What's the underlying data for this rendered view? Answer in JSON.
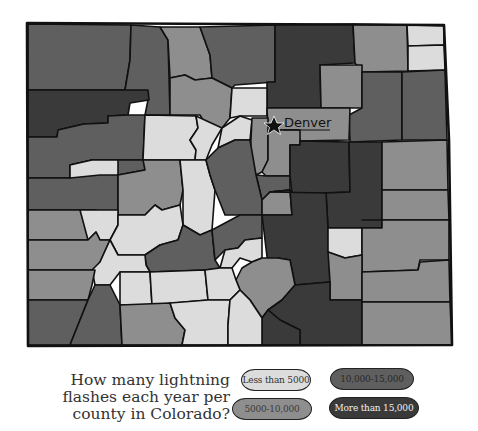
{
  "title": {
    "lines": [
      "How many lightning",
      "flashes each year per",
      "county in Colorado?"
    ]
  },
  "map": {
    "region": "Colorado",
    "city_label": "Denver",
    "city_marker": "star-icon"
  },
  "legend": {
    "items": [
      {
        "label": "Less than 5000",
        "color": "#dcdcdc",
        "text_color": "#333333"
      },
      {
        "label": "10,000-15,000",
        "color": "#5f5f5f",
        "text_color": "#2a2a2a"
      },
      {
        "label": "5000-10,000",
        "color": "#8e8e8e",
        "text_color": "#3a3a3a"
      },
      {
        "label": "More than 15,000",
        "color": "#3a3a3a",
        "text_color": "#f0f0f0"
      }
    ]
  },
  "colors": {
    "low": "#dcdcdc",
    "mid_low": "#8e8e8e",
    "mid_high": "#5f5f5f",
    "high": "#3a3a3a",
    "border": "#111111",
    "background": "#ffffff"
  }
}
